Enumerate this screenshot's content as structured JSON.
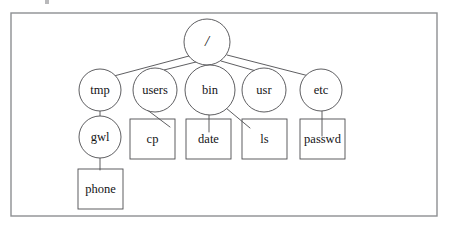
{
  "figure": {
    "background_color": "#ffffff",
    "frame_color": "#8d8f92",
    "stroke_color": "#4c4c4f",
    "text_color": "#141416"
  },
  "legend": {
    "circle_meaning": "directory",
    "rectangle_meaning": "file"
  },
  "nodes": {
    "root": {
      "label": "/",
      "shape": "circle",
      "kind": "directory",
      "cx": 207,
      "cy": 42,
      "r": 23
    },
    "tmp": {
      "label": "tmp",
      "shape": "circle",
      "kind": "directory",
      "cx": 100,
      "cy": 90,
      "r": 21
    },
    "users": {
      "label": "users",
      "shape": "circle",
      "kind": "directory",
      "cx": 155,
      "cy": 90,
      "r": 22
    },
    "bin": {
      "label": "bin",
      "shape": "circle",
      "kind": "directory",
      "cx": 210,
      "cy": 90,
      "r": 25
    },
    "usr": {
      "label": "usr",
      "shape": "circle",
      "kind": "directory",
      "cx": 264,
      "cy": 90,
      "r": 22
    },
    "etc": {
      "label": "etc",
      "shape": "circle",
      "kind": "directory",
      "cx": 321,
      "cy": 90,
      "r": 21
    },
    "gwl": {
      "label": "gwl",
      "shape": "circle",
      "kind": "directory",
      "cx": 100,
      "cy": 137,
      "r": 21
    },
    "cp": {
      "label": "cp",
      "shape": "rect",
      "kind": "file",
      "x": 130,
      "y": 119,
      "w": 45,
      "h": 40
    },
    "date": {
      "label": "date",
      "shape": "rect",
      "kind": "file",
      "x": 186,
      "y": 119,
      "w": 45,
      "h": 40
    },
    "ls": {
      "label": "ls",
      "shape": "rect",
      "kind": "file",
      "x": 242,
      "y": 119,
      "w": 45,
      "h": 40
    },
    "passwd": {
      "label": "passwd",
      "shape": "rect",
      "kind": "file",
      "x": 300,
      "y": 119,
      "w": 45,
      "h": 40
    },
    "phone": {
      "label": "phone",
      "shape": "rect",
      "kind": "file",
      "x": 78,
      "y": 169,
      "w": 45,
      "h": 40
    }
  },
  "edges": [
    {
      "from": "root",
      "to": "tmp",
      "x1": 189,
      "y1": 56,
      "x2": 114,
      "y2": 76
    },
    {
      "from": "root",
      "to": "users",
      "x1": 196,
      "y1": 62,
      "x2": 164,
      "y2": 70
    },
    {
      "from": "root",
      "to": "bin",
      "x1": 208,
      "y1": 65,
      "x2": 208,
      "y2": 80
    },
    {
      "from": "root",
      "to": "usr",
      "x1": 221,
      "y1": 61,
      "x2": 256,
      "y2": 71
    },
    {
      "from": "root",
      "to": "etc",
      "x1": 227,
      "y1": 55,
      "x2": 309,
      "y2": 76
    },
    {
      "from": "tmp",
      "to": "gwl",
      "x1": 100,
      "y1": 111,
      "x2": 100,
      "y2": 116
    },
    {
      "from": "users",
      "to": "cp",
      "x1": 146,
      "y1": 109,
      "x2": 170,
      "y2": 127
    },
    {
      "from": "bin",
      "to": "date",
      "x1": 209,
      "y1": 114,
      "x2": 209,
      "y2": 132
    },
    {
      "from": "bin",
      "to": "ls",
      "x1": 226,
      "y1": 108,
      "x2": 250,
      "y2": 128
    },
    {
      "from": "etc",
      "to": "passwd",
      "x1": 322,
      "y1": 111,
      "x2": 322,
      "y2": 136
    },
    {
      "from": "gwl",
      "to": "phone",
      "x1": 100,
      "y1": 158,
      "x2": 100,
      "y2": 170
    }
  ],
  "frame": {
    "x": 11,
    "y": 13,
    "w": 426,
    "h": 203
  }
}
